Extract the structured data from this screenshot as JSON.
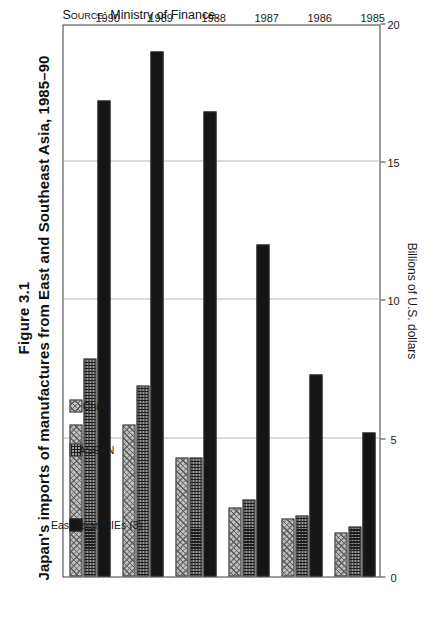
{
  "figure": {
    "number": "Figure 3.1",
    "title": "Japan's imports of manufactures from East and Southeast Asia, 1985–90",
    "source_prefix": "Source:",
    "source_text": " Ministry of Finance."
  },
  "legend": {
    "items": [
      {
        "label": "East Asian NIEs (3)",
        "key": "nies",
        "color": "#151515"
      },
      {
        "label": "ASEAN",
        "key": "asean",
        "color": "#9d9d9d"
      },
      {
        "label": "China",
        "key": "china",
        "color": "#c2c2c2"
      }
    ]
  },
  "axis": {
    "title": "Billions of U.S. dollars",
    "ticks": [
      "0",
      "5",
      "10",
      "15",
      "20"
    ],
    "min": 0,
    "max": 20
  },
  "chart_data": {
    "type": "bar",
    "orientation": "horizontal",
    "title": "Japan's imports of manufactures from East and Southeast Asia, 1985–90",
    "subtitle": "Figure 3.1",
    "xlabel": "Billions of U.S. dollars",
    "ylabel": "",
    "xlim": [
      0,
      20
    ],
    "grid": true,
    "legend_position": "inside-top-left",
    "categories": [
      "1985",
      "1986",
      "1987",
      "1988",
      "1989",
      "1990"
    ],
    "series": [
      {
        "name": "East Asian NIEs (3)",
        "values": [
          5.2,
          7.3,
          12.0,
          16.8,
          19.0,
          17.2
        ]
      },
      {
        "name": "ASEAN",
        "values": [
          1.8,
          2.2,
          2.8,
          4.3,
          6.9,
          7.9
        ]
      },
      {
        "name": "China",
        "values": [
          1.6,
          2.1,
          2.5,
          4.3,
          5.5,
          5.5
        ]
      }
    ],
    "source": "Ministry of Finance."
  }
}
